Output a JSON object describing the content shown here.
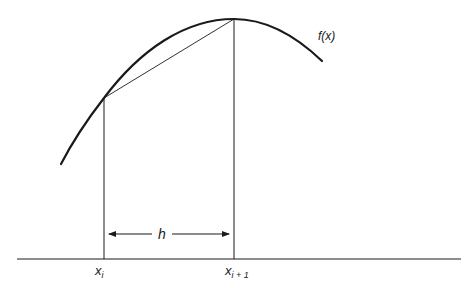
{
  "diagram": {
    "function_label": "f(x)",
    "left_point_label": {
      "base": "x",
      "subscript": "i"
    },
    "right_point_label": {
      "base": "x",
      "subscript": "i + 1"
    },
    "interval_label": "h",
    "colors": {
      "stroke": "#1a1a1a",
      "background": "#ffffff"
    }
  }
}
